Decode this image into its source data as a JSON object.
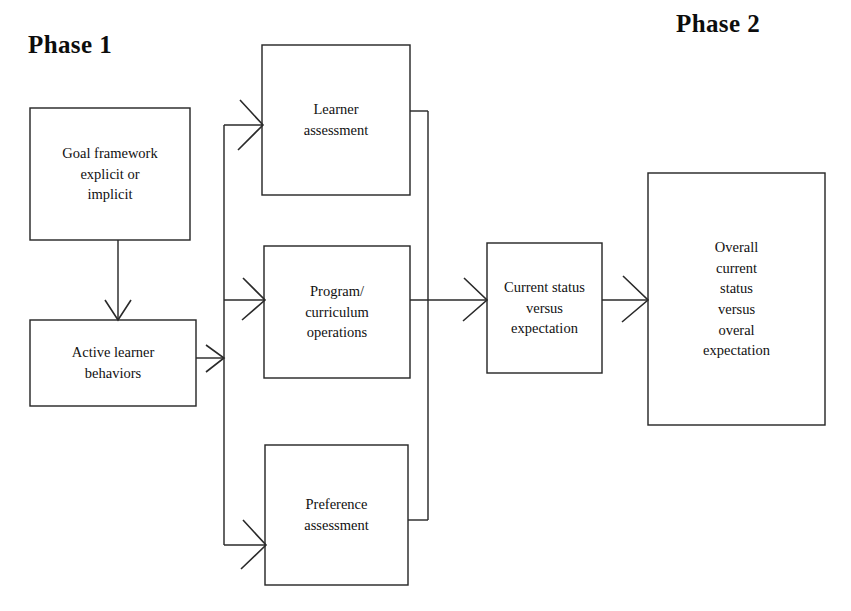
{
  "diagram": {
    "title_phase1": "Phase 1",
    "title_phase2": "Phase 2",
    "nodes": {
      "goal_framework": "Goal framework\nexplicit  or\nimplicit",
      "active_learner": "Active  learner\nbehaviors",
      "learner_assessment": "Learner\nassessment",
      "program_curriculum": "Program/\ncurriculum\noperations",
      "preference_assessment": "Preference\nassessment",
      "current_status": "Current status\nversus\nexpectation",
      "overall_status": "Overall\ncurrent\nstatus\nversus\noveral\nexpectation"
    },
    "colors": {
      "stroke": "#2a2a2a",
      "text": "#111111",
      "background": "#ffffff"
    }
  }
}
